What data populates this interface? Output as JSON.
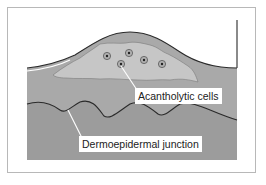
{
  "figure": {
    "type": "schematic cross-section of skin blister",
    "colors": {
      "frame_border": "#b8b8b8",
      "tissue_fill": "#a8a8a8",
      "blister_fill": "#c4c4c4",
      "outline": "#2a2a2a",
      "label_bg": "#ffffff"
    },
    "labels": {
      "acantholytic_cells": "Acantholytic cells",
      "dermoepidermal_junction": "Dermoepidermal junction"
    },
    "cells": [
      {
        "x": 107,
        "y": 56
      },
      {
        "x": 129,
        "y": 53
      },
      {
        "x": 144,
        "y": 60
      },
      {
        "x": 162,
        "y": 64
      },
      {
        "x": 121,
        "y": 64
      }
    ]
  }
}
